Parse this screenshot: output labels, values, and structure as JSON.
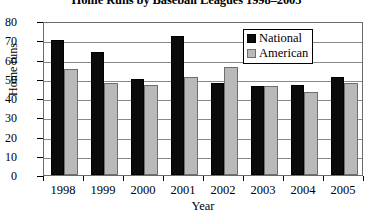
{
  "chart_data": {
    "type": "bar",
    "title": "Home Runs by Baseball Leagues 1998–2005",
    "xlabel": "Year",
    "ylabel": "Home runs",
    "categories": [
      "1998",
      "1999",
      "2000",
      "2001",
      "2002",
      "2003",
      "2004",
      "2005"
    ],
    "series": [
      {
        "name": "National",
        "color": "#0b0b0b",
        "values": [
          70,
          64,
          50,
          72,
          48,
          46,
          47,
          51
        ]
      },
      {
        "name": "American",
        "color": "#b9b9b9",
        "values": [
          55,
          48,
          47,
          51,
          56,
          46,
          43,
          48
        ]
      }
    ],
    "ylim": [
      0,
      80
    ],
    "ytick_step": 10,
    "yticks": [
      "80",
      "70",
      "60",
      "50",
      "40",
      "30",
      "20",
      "10",
      "0"
    ],
    "grid": true,
    "legend_position": "top-right"
  },
  "legend": {
    "entries": [
      {
        "label": "National"
      },
      {
        "label": "American"
      }
    ]
  }
}
